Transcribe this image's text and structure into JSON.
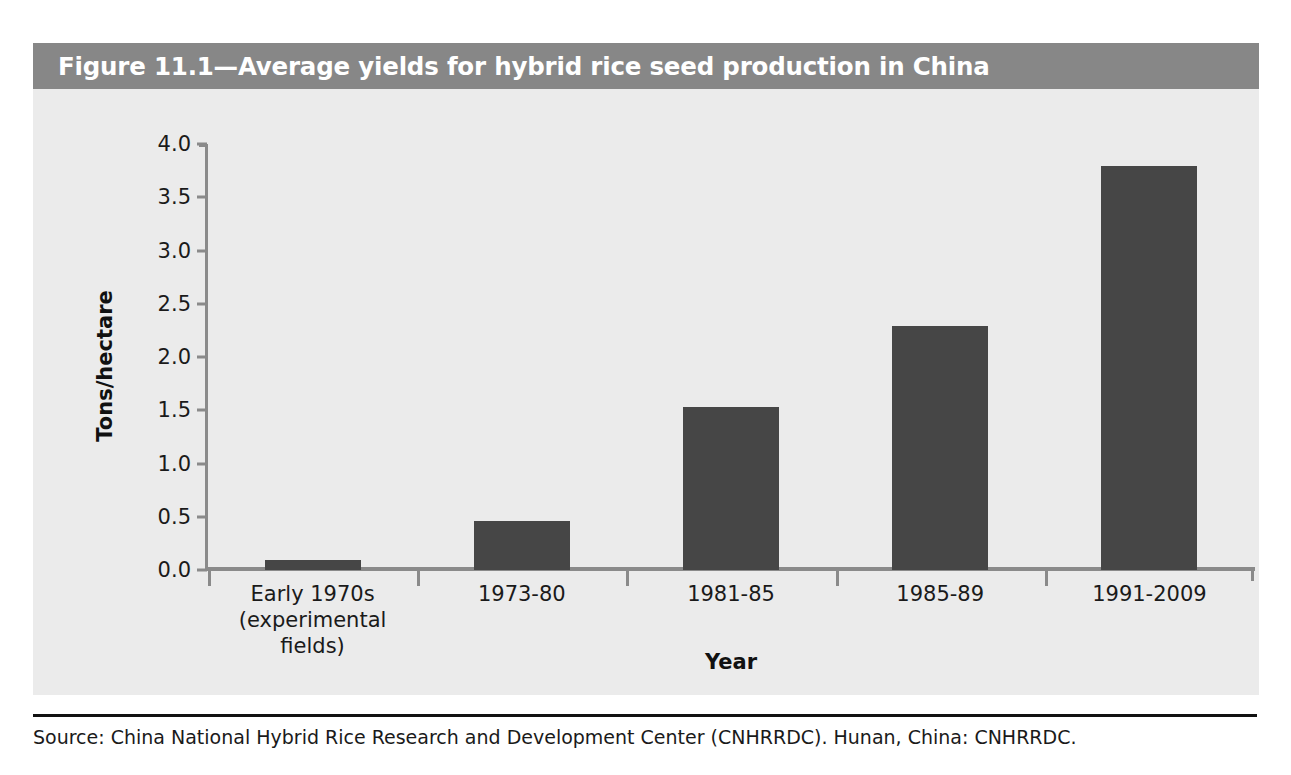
{
  "figure": {
    "title": "Figure 11.1—Average yields for hybrid rice seed production in China",
    "source": "Source: China National Hybrid Rice Research and Development Center (CNHRRDC). Hunan, China: CNHRRDC.",
    "title_band_color": "#878787",
    "panel_color": "#ebebeb",
    "bar_color": "#464646",
    "axis_color": "#8a8a8a"
  },
  "chart_data": {
    "type": "bar",
    "title": "Figure 11.1—Average yields for hybrid rice seed production in China",
    "xlabel": "Year",
    "ylabel": "Tons/hectare",
    "categories": [
      "Early 1970s\n(experimental\nfields)",
      "1973-80",
      "1981-85",
      "1985-89",
      "1991-2009"
    ],
    "category_lines": [
      [
        "Early 1970s",
        "(experimental",
        "fields)"
      ],
      [
        "1973-80"
      ],
      [
        "1981-85"
      ],
      [
        "1985-89"
      ],
      [
        "1991-2009"
      ]
    ],
    "values": [
      0.09,
      0.46,
      1.53,
      2.29,
      3.79
    ],
    "ylim": [
      0.0,
      4.0
    ],
    "yticks": [
      0.0,
      0.5,
      1.0,
      1.5,
      2.0,
      2.5,
      3.0,
      3.5,
      4.0
    ],
    "ytick_labels": [
      "0.0",
      "0.5",
      "1.0",
      "1.5",
      "2.0",
      "2.5",
      "3.0",
      "3.5",
      "4.0"
    ],
    "grid": false,
    "legend": null,
    "series_color": "#464646"
  }
}
